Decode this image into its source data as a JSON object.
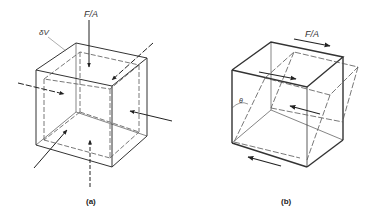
{
  "figure": {
    "panels": [
      {
        "id": "a",
        "caption": "(a)",
        "labels": {
          "force_per_area": "F/A",
          "volume_element": "δV"
        },
        "description": "Cube volume element under hydrostatic compression: arrows normal to every face pointing inward"
      },
      {
        "id": "b",
        "caption": "(b)",
        "labels": {
          "force_per_area": "F/A",
          "angle": "θ"
        },
        "description": "Cube under shear: opposite tangential forces on top and bottom faces; dashed outline shows sheared shape with shear angle θ"
      }
    ],
    "colors": {
      "line": "#333333",
      "dashed": "#555555",
      "background": "#ffffff"
    }
  }
}
